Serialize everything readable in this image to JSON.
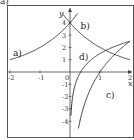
{
  "corner_label": "a)",
  "chart_data": {
    "type": "line",
    "title": "",
    "xlabel": "x",
    "ylabel": "y",
    "xlim": [
      -2.1,
      2.1
    ],
    "ylim": [
      -5,
      4.8
    ],
    "grid": false,
    "x_ticks": [
      -2,
      -1,
      0,
      1,
      2
    ],
    "x_tick_labels": [
      "-2",
      "-1",
      "0",
      "1",
      "2"
    ],
    "y_ticks": [
      -4,
      -3,
      -2,
      -1,
      1,
      2,
      3,
      4
    ],
    "y_tick_labels": [
      "-4",
      "-3",
      "-2",
      "-1",
      "1",
      "2",
      "3",
      "4"
    ],
    "series": [
      {
        "name": "a)",
        "formula": "4*2^x",
        "label_pos": [
          -1.9,
          1.3
        ]
      },
      {
        "name": "b)",
        "formula": "4*(1/2)^x",
        "label_pos": [
          0.35,
          3.5
        ]
      },
      {
        "name": "c)",
        "formula": "2.5*log2(x)",
        "label_pos": [
          1.2,
          -2.1
        ]
      },
      {
        "name": "d)",
        "formula": "log2(x)+1.5",
        "label_pos": [
          0.3,
          1.0
        ]
      }
    ],
    "legend": "none (inline labels)"
  }
}
